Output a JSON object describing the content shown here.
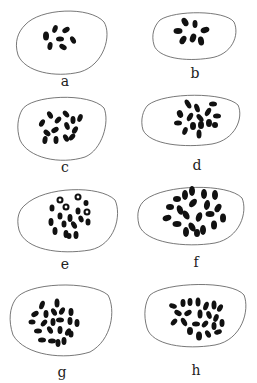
{
  "figure": {
    "panels": [
      {
        "label": "a",
        "description": "cell with few condensed chromosomes"
      },
      {
        "label": "b",
        "description": "cell with rosette of chromosomes"
      },
      {
        "label": "c",
        "description": "cell with dispersed chromosomes"
      },
      {
        "label": "d",
        "description": "cell with clustered chromosomes"
      },
      {
        "label": "e",
        "description": "cell with ring-like chromosomes"
      },
      {
        "label": "f",
        "description": "cell with many chromosomes"
      },
      {
        "label": "g",
        "description": "cell with many chromosomes"
      },
      {
        "label": "h",
        "description": "cell with many chromosomes"
      }
    ]
  }
}
